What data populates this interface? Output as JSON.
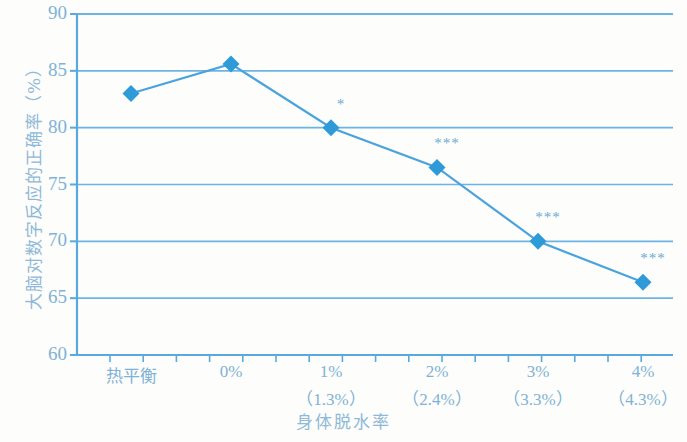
{
  "chart_data": {
    "type": "line",
    "title": "",
    "subtitle": "",
    "xlabel": "身体脱水率",
    "ylabel": "大脑对数字反应的正确率（%）",
    "categories": [
      "热平衡",
      "0%",
      "1%",
      "2%",
      "3%",
      "4%"
    ],
    "category_sublabels": [
      "",
      "",
      "（1.3%）",
      "（2.4%）",
      "（3.3%）",
      "（4.3%）"
    ],
    "values": [
      83.0,
      85.6,
      80.0,
      76.5,
      70.0,
      66.4
    ],
    "annotations": [
      "",
      "",
      "*",
      "***",
      "***",
      "***"
    ],
    "ylim": [
      60,
      90
    ],
    "yticks": [
      60,
      65,
      70,
      75,
      80,
      85,
      90
    ],
    "ytick_labels": [
      "60",
      "65",
      "70",
      "75",
      "80",
      "85",
      "90"
    ],
    "grid": true,
    "grid_axis": "y",
    "legend": "none",
    "series_name": "大脑对数字反应的正确率",
    "marker": "diamond",
    "colors": {
      "line": "#4ba3dd",
      "marker": "#2e9bd8",
      "grid": "#6cb4e4",
      "axis": "#5aa9de",
      "tick_text": "#7fb2d6",
      "axis_title": "#8fb9d8",
      "background": "#fdfdfb"
    }
  }
}
